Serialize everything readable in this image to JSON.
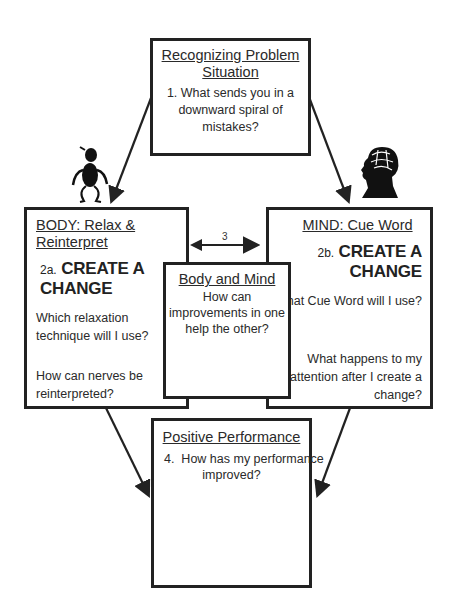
{
  "diagram": {
    "top_box": {
      "title": "Recognizing Problem Situation",
      "title_line1": "Recognizing Problem",
      "title_line2": "Situation",
      "question": "1. What sends you in a downward spiral of mistakes?",
      "question_line1": "1. What sends you in a",
      "question_line2": "downward spiral of mistakes?"
    },
    "body_box": {
      "title": "BODY: Relax & Reinterpret",
      "step_number": "2a.",
      "step_label": "CREATE A CHANGE",
      "question1_line1": "Which relaxation",
      "question1_line2": "technique will I use?",
      "question2_line1": "How can nerves be",
      "question2_line2": "reinterpreted?"
    },
    "mind_box": {
      "title": "MIND: Cue Word",
      "step_number": "2b.",
      "step_label": "CREATE A CHANGE",
      "question1": "What Cue Word will I use?",
      "question2_line1": "What happens to my",
      "question2_line2": "attention after I create a",
      "question2_line3": "change?"
    },
    "middle_box": {
      "title": "Body and Mind",
      "question_line1": "How can",
      "question_line2": "improvements in one",
      "question_line3": "help the other?"
    },
    "double_arrow_label": "3",
    "bottom_box": {
      "title": "Positive Performance",
      "question_line1": "4.  How has my performance",
      "question_line2": "improved?"
    },
    "icons": [
      "stick-figure-icon",
      "head-brain-icon"
    ],
    "colors": {
      "line": "#222222",
      "background": "#ffffff"
    }
  }
}
